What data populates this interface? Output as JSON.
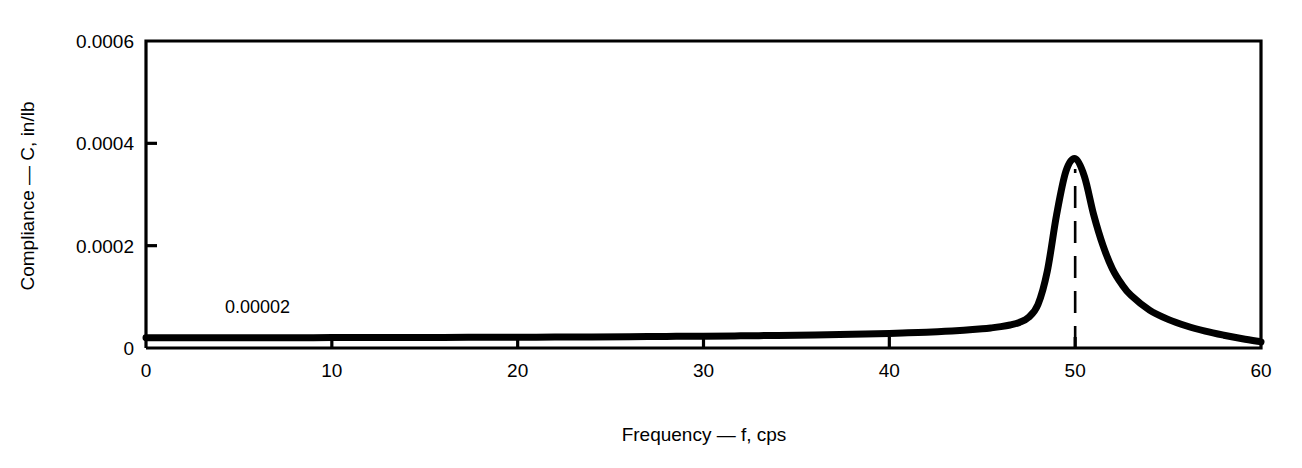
{
  "chart_data": {
    "type": "line",
    "title": "",
    "subtitle": "",
    "xlabel": "Frequency — f, cps",
    "ylabel": "Compliance — C, in/lb",
    "xlim": [
      0,
      60
    ],
    "ylim": [
      0,
      0.0006
    ],
    "grid": false,
    "legend": null,
    "legend_position": "none",
    "x_ticks": [
      0,
      10,
      20,
      30,
      40,
      50,
      60
    ],
    "x_tick_labels": [
      "0",
      "10",
      "20",
      "30",
      "40",
      "50",
      "60"
    ],
    "y_ticks": [
      0,
      0.0002,
      0.0004,
      0.0006
    ],
    "y_tick_labels": [
      "0",
      "0.0002",
      "0.0004",
      "0.0006"
    ],
    "tick_direction": "in",
    "series": [
      {
        "name": "Compliance",
        "color": "#000000",
        "x": [
          0,
          2,
          4,
          6,
          8,
          10,
          12,
          14,
          16,
          18,
          20,
          22,
          24,
          26,
          28,
          30,
          32,
          34,
          36,
          38,
          40,
          41,
          42,
          43,
          44,
          45,
          45.5,
          46,
          46.5,
          47,
          47.5,
          48,
          48.5,
          49,
          49.5,
          50,
          50.5,
          51,
          51.5,
          52,
          52.5,
          53,
          54,
          55,
          56,
          57,
          58,
          59,
          60
        ],
        "y": [
          2e-05,
          2e-05,
          2.01e-05,
          2.01e-05,
          2.02e-05,
          2.03e-05,
          2.04e-05,
          2.05e-05,
          2.07e-05,
          2.09e-05,
          2.11e-05,
          2.14e-05,
          2.17e-05,
          2.21e-05,
          2.26e-05,
          2.31e-05,
          2.38e-05,
          2.46e-05,
          2.56e-05,
          2.69e-05,
          2.85e-05,
          2.96e-05,
          3.09e-05,
          3.25e-05,
          3.46e-05,
          3.74e-05,
          3.93e-05,
          4.17e-05,
          4.5e-05,
          5e-05,
          6e-05,
          8.5e-05,
          0.00015,
          0.00026,
          0.000345,
          0.00037,
          0.000335,
          0.00026,
          0.0002,
          0.000155,
          0.000125,
          0.000103,
          7.4e-05,
          5.6e-05,
          4.3e-05,
          3.3e-05,
          2.5e-05,
          1.8e-05,
          1.2e-05
        ]
      }
    ],
    "annotations": [
      {
        "name": "baseline-value",
        "text": "0.00002",
        "x": 6.0,
        "y": 6.9e-05
      }
    ],
    "markers": [
      {
        "name": "resonance-frequency-marker",
        "style": "dashed-vertical",
        "x": 50,
        "y_from": 0,
        "y_to": 0.00035
      }
    ]
  }
}
